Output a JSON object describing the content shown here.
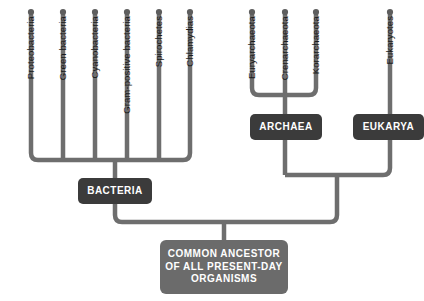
{
  "diagram": {
    "colors": {
      "branch": "#6e6e6e",
      "dark_box": "#3b3b3b",
      "light_box": "#6b6b6b",
      "label_text": "#1a1a1a",
      "box_text": "#ffffff",
      "background": "#ffffff"
    }
  },
  "bacteria_branches": [
    {
      "label": "Proteobacteria",
      "x": 31
    },
    {
      "label": "Green bacteria",
      "x": 63
    },
    {
      "label": "Cyanobacteria",
      "x": 95
    },
    {
      "label": "Gram-positive bacteria",
      "x": 127
    },
    {
      "label": "Spirochetes",
      "x": 159
    },
    {
      "label": "Chlamydias",
      "x": 190
    }
  ],
  "archaea_branches": [
    {
      "label": "Euryarchaeota",
      "x": 252
    },
    {
      "label": "Crenarchaeota",
      "x": 285
    },
    {
      "label": "Korarchaeota",
      "x": 316
    }
  ],
  "eukarya_branches": [
    {
      "label": "Eukaryotes",
      "x": 390
    }
  ],
  "domain_boxes": [
    {
      "name": "bacteria",
      "label": "BACTERIA",
      "x": 78,
      "y": 178,
      "w": 74,
      "h": 26,
      "style": "dark"
    },
    {
      "name": "archaea",
      "label": "ARCHAEA",
      "x": 250,
      "y": 114,
      "w": 72,
      "h": 26,
      "style": "dark"
    },
    {
      "name": "eukarya",
      "label": "EUKARYA",
      "x": 353,
      "y": 114,
      "w": 71,
      "h": 26,
      "style": "dark"
    }
  ],
  "root_box": {
    "name": "common-ancestor",
    "lines": [
      "COMMON ANCESTOR",
      "OF ALL PRESENT-DAY",
      "ORGANISMS"
    ],
    "x": 160,
    "y": 240,
    "w": 128,
    "h": 54,
    "style": "light"
  }
}
